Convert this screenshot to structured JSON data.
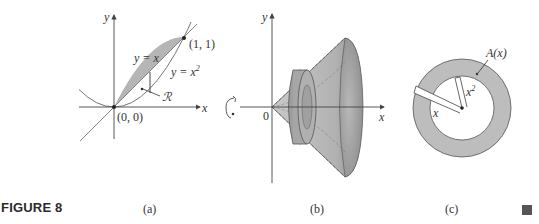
{
  "figure": {
    "title": "FIGURE 8",
    "end_marker": "square"
  },
  "panels": {
    "a": {
      "caption": "(a)",
      "y_axis_label": "y",
      "x_axis_label": "x",
      "line_label": "y = x",
      "curve_label_base": "y = x",
      "curve_label_exp": "2",
      "region_label": "ℛ",
      "point_top": "(1, 1)",
      "point_origin": "(0, 0)"
    },
    "b": {
      "caption": "(b)",
      "y_axis_label": "y",
      "x_axis_label": "x",
      "origin_label": "0",
      "rotation_icon": "rotation-arrow-icon"
    },
    "c": {
      "caption": "(c)",
      "area_label": "A(x)",
      "outer_radius_label": "x",
      "inner_radius_label_base": "x",
      "inner_radius_label_exp": "2"
    }
  },
  "colors": {
    "region_fill": "#b5b5b5",
    "solid_fill": "#a9a9a9",
    "ring_fill": "#bdbdbd",
    "axis": "#444444"
  }
}
